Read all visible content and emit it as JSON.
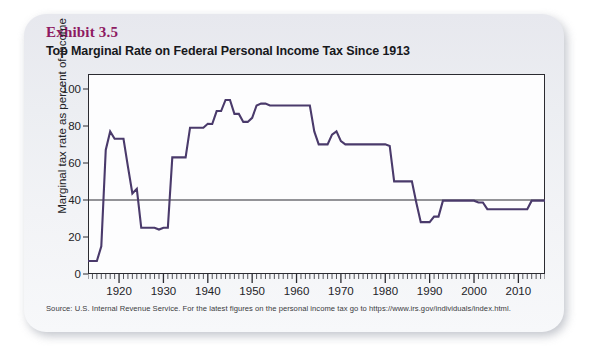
{
  "card": {
    "exhibit_label": "Exhibit 3.5",
    "title": "Top Marginal Rate on Federal Personal Income Tax Since 1913",
    "source": "Source: U.S. Internal Revenue Service. For the latest figures on the personal income tax go to https://www.irs.gov/individuals/index.html.",
    "accent_color": "#8e1a62",
    "line_color": "#4a3a6b",
    "background_color": "#eceef2",
    "plot_background": "#fdfdfe",
    "axis_color": "#2b2b31"
  },
  "chart_data": {
    "type": "line",
    "title": "Top Marginal Rate on Federal Personal Income Tax Since 1913",
    "xlabel": "",
    "ylabel": "Marginal tax rate as percent of income",
    "xlim": [
      1913,
      2016
    ],
    "ylim": [
      0,
      108
    ],
    "yticks": [
      0,
      20,
      40,
      60,
      80,
      100
    ],
    "xticks": [
      1920,
      1930,
      1940,
      1950,
      1960,
      1970,
      1980,
      1990,
      2000,
      2010
    ],
    "x_minor_tick_interval": 1,
    "grid": false,
    "legend": "none",
    "reference_line": {
      "value": 40,
      "label": "",
      "color": "#2b2b31"
    },
    "series": [
      {
        "name": "Top marginal federal personal income tax rate",
        "color": "#4a3a6b",
        "x": [
          1913,
          1914,
          1915,
          1916,
          1917,
          1918,
          1919,
          1920,
          1921,
          1922,
          1923,
          1924,
          1925,
          1926,
          1927,
          1928,
          1929,
          1930,
          1931,
          1932,
          1933,
          1934,
          1935,
          1936,
          1937,
          1938,
          1939,
          1940,
          1941,
          1942,
          1943,
          1944,
          1945,
          1946,
          1947,
          1948,
          1949,
          1950,
          1951,
          1952,
          1953,
          1954,
          1955,
          1956,
          1957,
          1958,
          1959,
          1960,
          1961,
          1962,
          1963,
          1964,
          1965,
          1966,
          1967,
          1968,
          1969,
          1970,
          1971,
          1972,
          1973,
          1974,
          1975,
          1976,
          1977,
          1978,
          1979,
          1980,
          1981,
          1982,
          1983,
          1984,
          1985,
          1986,
          1987,
          1988,
          1989,
          1990,
          1991,
          1992,
          1993,
          1994,
          1995,
          1996,
          1997,
          1998,
          1999,
          2000,
          2001,
          2002,
          2003,
          2004,
          2005,
          2006,
          2007,
          2008,
          2009,
          2010,
          2011,
          2012,
          2013,
          2014,
          2015,
          2016
        ],
        "values": [
          7,
          7,
          7,
          15,
          67,
          77,
          73,
          73,
          73,
          58,
          43.5,
          46,
          25,
          25,
          25,
          25,
          24,
          25,
          25,
          63,
          63,
          63,
          63,
          79,
          79,
          79,
          79,
          81.1,
          81,
          88,
          88,
          94,
          94,
          86.45,
          86.45,
          82.13,
          82.13,
          84.36,
          91,
          92,
          92,
          91,
          91,
          91,
          91,
          91,
          91,
          91,
          91,
          91,
          91,
          77,
          70,
          70,
          70,
          75.25,
          77,
          71.75,
          70,
          70,
          70,
          70,
          70,
          70,
          70,
          70,
          70,
          70,
          69.125,
          50,
          50,
          50,
          50,
          50,
          38.5,
          28,
          28,
          28,
          31,
          31,
          39.6,
          39.6,
          39.6,
          39.6,
          39.6,
          39.6,
          39.6,
          39.6,
          38.6,
          38.6,
          35,
          35,
          35,
          35,
          35,
          35,
          35,
          35,
          35,
          35,
          39.6,
          39.6,
          39.6,
          39.6
        ]
      }
    ]
  }
}
